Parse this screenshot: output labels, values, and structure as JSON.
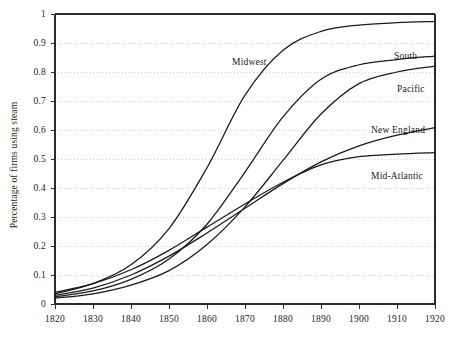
{
  "chart_data": {
    "type": "line",
    "title": "",
    "xlabel": "",
    "ylabel": "Percentage of firms using steam",
    "xlim": [
      1820,
      1920
    ],
    "ylim": [
      0,
      1
    ],
    "grid": true,
    "grid_style": "dotted-horizontal",
    "legend": "inline-labels",
    "x_ticks": [
      "1820",
      "1830",
      "1840",
      "1850",
      "1860",
      "1870",
      "1880",
      "1890",
      "1900",
      "1910",
      "1920"
    ],
    "y_ticks": [
      "0",
      "0.1",
      "0.2",
      "0.3",
      "0.4",
      "0.5",
      "0.6",
      "0.7",
      "0.8",
      "0.9",
      "1"
    ],
    "x": [
      1820,
      1830,
      1840,
      1850,
      1860,
      1870,
      1880,
      1890,
      1900,
      1910,
      1920
    ],
    "series": [
      {
        "name": "Midwest",
        "label": "Midwest",
        "color": "#1a1a1a",
        "values": [
          0.035,
          0.07,
          0.135,
          0.26,
          0.47,
          0.72,
          0.875,
          0.94,
          0.962,
          0.97,
          0.974
        ]
      },
      {
        "name": "South",
        "label": "South",
        "color": "#1a1a1a",
        "values": [
          0.025,
          0.045,
          0.085,
          0.155,
          0.275,
          0.455,
          0.645,
          0.775,
          0.825,
          0.843,
          0.855
        ]
      },
      {
        "name": "Pacific",
        "label": "Pacific",
        "color": "#1a1a1a",
        "values": [
          0.02,
          0.035,
          0.065,
          0.115,
          0.205,
          0.335,
          0.495,
          0.655,
          0.76,
          0.8,
          0.82
        ]
      },
      {
        "name": "New England",
        "label": "New England",
        "color": "#1a1a1a",
        "values": [
          0.03,
          0.055,
          0.1,
          0.165,
          0.245,
          0.33,
          0.415,
          0.49,
          0.545,
          0.582,
          0.608
        ]
      },
      {
        "name": "Mid-Atlantic",
        "label": "Mid-Atlantic",
        "color": "#1a1a1a",
        "values": [
          0.04,
          0.07,
          0.118,
          0.185,
          0.265,
          0.345,
          0.42,
          0.48,
          0.508,
          0.517,
          0.522
        ]
      }
    ],
    "series_label_positions": [
      {
        "name": "Midwest",
        "x": 232,
        "y": 57
      },
      {
        "name": "South",
        "x": 394,
        "y": 51
      },
      {
        "name": "Pacific",
        "x": 397,
        "y": 84
      },
      {
        "name": "New England",
        "x": 371,
        "y": 125
      },
      {
        "name": "Mid-Atlantic",
        "x": 371,
        "y": 171
      }
    ],
    "axis_color": "#2b2b2b",
    "grid_color": "#b9b9b9",
    "line_color": "#1a1a1a",
    "background": "#ffffff"
  },
  "plot_geometry": {
    "left": 55,
    "right": 435,
    "top": 14,
    "bottom": 304
  }
}
